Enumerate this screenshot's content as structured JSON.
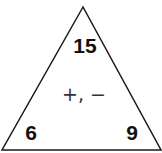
{
  "fact_family_triangle": {
    "top_number": "15",
    "bottom_left_number": "6",
    "bottom_right_number": "9",
    "operations": "+, −"
  },
  "colors": {
    "stroke": "#1a1a1a",
    "text": "#111111",
    "operations_text": "#333333",
    "background": "#ffffff"
  }
}
